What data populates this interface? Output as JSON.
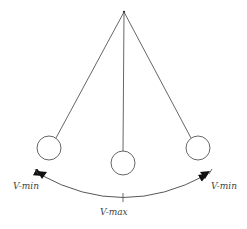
{
  "diagram": {
    "stroke_color": "#555555",
    "arrow_color": "#111111",
    "labels": {
      "left_min": "V-min",
      "right_min": "V-min",
      "bottom_max": "V-max"
    },
    "pivot": {
      "x": 124,
      "y": 12
    },
    "bobs": [
      {
        "position": "left",
        "cx": 49,
        "cy": 148,
        "r": 12
      },
      {
        "position": "center",
        "cx": 123,
        "cy": 163,
        "r": 12
      },
      {
        "position": "right",
        "cx": 198,
        "cy": 148,
        "r": 12
      }
    ]
  }
}
